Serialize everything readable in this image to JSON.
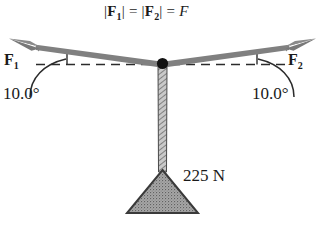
{
  "figure": {
    "type": "free-body-diagram",
    "title_equation": {
      "full_text": "|F1| = |F2| = F",
      "part1_bar_open": "|",
      "part1_symbol": "F",
      "part1_sub": "1",
      "part1_bar_close": "|",
      "equals_1": "=",
      "part2_bar_open": "|",
      "part2_symbol": "F",
      "part2_sub": "2",
      "part2_bar_close": "|",
      "equals_2": "=",
      "result_symbol": "F"
    },
    "force_left": {
      "label_symbol": "F",
      "label_sub": "1",
      "angle_text": "10.0°",
      "angle_value": 10.0,
      "direction": "up-left"
    },
    "force_right": {
      "label_symbol": "F",
      "label_sub": "2",
      "angle_text": "10.0°",
      "angle_value": 10.0,
      "direction": "up-right"
    },
    "weight": {
      "label": "225 N",
      "magnitude": 225,
      "unit": "N",
      "shape": "triangle"
    },
    "reference_line": "horizontal-dashed",
    "junction": "knot-point"
  },
  "colors": {
    "arrow_gray": "#808080",
    "arrow_gray_dark": "#6e6e6e",
    "ink": "#1a1a1a",
    "rope_fill": "#b0b0b0",
    "weight_fill": "#9a9a9a",
    "weight_stroke": "#3a3a3a",
    "background": "#ffffff"
  }
}
